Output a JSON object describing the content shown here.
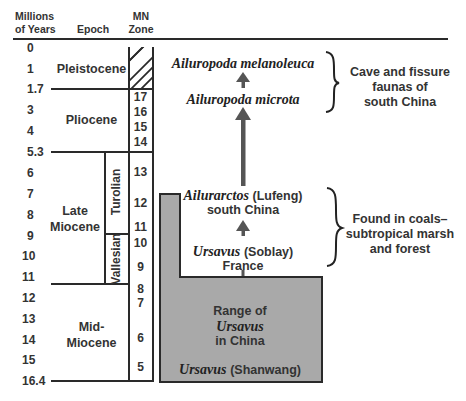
{
  "header": {
    "col_years": [
      "Millions",
      "of Years"
    ],
    "col_epoch": "Epoch",
    "col_zone": [
      "MN",
      "Zone"
    ]
  },
  "years": [
    "0",
    "1",
    "1.7",
    "3",
    "4",
    "5.3",
    "6",
    "7",
    "8",
    "9",
    "10",
    "11",
    "12",
    "13",
    "14",
    "15",
    "16.4"
  ],
  "epochs": {
    "pleistocene": "Pleistocene",
    "pliocene": "Pliocene",
    "late_miocene": [
      "Late",
      "Miocene"
    ],
    "mid_miocene": [
      "Mid-",
      "Miocene"
    ]
  },
  "stages": {
    "turolian": "Turolian",
    "vallesian": "Vallesian"
  },
  "zones": [
    "17",
    "16",
    "15",
    "14",
    "13",
    "12",
    "11",
    "10",
    "9",
    "8",
    "7",
    "6",
    "5"
  ],
  "species": {
    "melanoleuca": "Ailuropoda melanoleuca",
    "microta": "Ailuropoda microta",
    "ailurarctos_name": "Ailurarctos",
    "ailurarctos_site": "(Lufeng)",
    "ailurarctos_region": "south China",
    "ursavus_soblay_name": "Ursavus",
    "ursavus_soblay_site": "(Soblay)",
    "ursavus_soblay_region": "France",
    "range_line1": "Range of",
    "range_line2": "Ursavus",
    "range_line3": "in China",
    "shanwang_name": "Ursavus",
    "shanwang_site": "(Shanwang)"
  },
  "notes": {
    "cave": [
      "Cave and fissure",
      "faunas of",
      "south China"
    ],
    "coal": [
      "Found in coals–",
      "subtropical marsh",
      "and forest"
    ]
  },
  "colors": {
    "range_fill": "#a9a9a9",
    "line": "#2a2a2a",
    "arrow": "#555555"
  }
}
